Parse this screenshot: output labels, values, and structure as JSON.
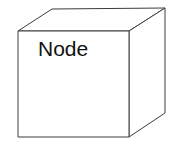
{
  "diagram": {
    "type": "uml-deployment-node",
    "shape": "3d-box",
    "label": "Node",
    "title": "Node",
    "colors": {
      "background": "#ffffff",
      "face_fill": "#ffffff",
      "stroke": "#3c3c3c",
      "label_color": "#111111"
    },
    "geometry": {
      "front_face": "18,31 129,31 129,137 18,137",
      "top_face": "18,31 52,9 165,8 129,31",
      "side_face": "129,31 165,8 165,113 129,137"
    },
    "label_position": {
      "x": 38,
      "y": 56
    }
  }
}
